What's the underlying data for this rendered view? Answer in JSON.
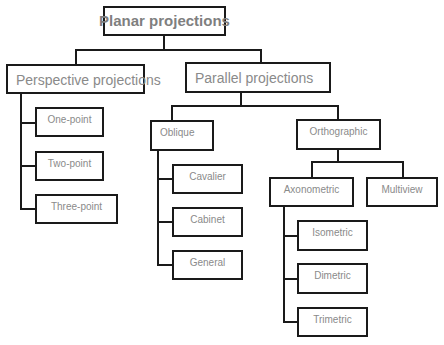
{
  "diagram": {
    "type": "tree",
    "root": {
      "label": "Planar projections",
      "children": [
        {
          "label": "Perspective projections",
          "children": [
            {
              "label": "One-point"
            },
            {
              "label": "Two-point"
            },
            {
              "label": "Three-point"
            }
          ]
        },
        {
          "label": "Parallel projections",
          "children": [
            {
              "label": "Oblique",
              "children": [
                {
                  "label": "Cavalier"
                },
                {
                  "label": "Cabinet"
                },
                {
                  "label": "General"
                }
              ]
            },
            {
              "label": "Orthographic",
              "children": [
                {
                  "label": "Axonometric",
                  "children": [
                    {
                      "label": "Isometric"
                    },
                    {
                      "label": "Dimetric"
                    },
                    {
                      "label": "Trimetric"
                    }
                  ]
                },
                {
                  "label": "Multiview"
                }
              ]
            }
          ]
        }
      ]
    }
  },
  "nodes": {
    "planar": "Planar projections",
    "perspective": "Perspective projections",
    "one_point": "One-point",
    "two_point": "Two-point",
    "three_point": "Three-point",
    "parallel": "Parallel projections",
    "oblique": "Oblique",
    "cavalier": "Cavalier",
    "cabinet": "Cabinet",
    "general": "General",
    "orthographic": "Orthographic",
    "axonometric": "Axonometric",
    "multiview": "Multiview",
    "isometric": "Isometric",
    "dimetric": "Dimetric",
    "trimetric": "Trimetric"
  },
  "colors": {
    "border": "#1a1a1a",
    "text": "#8a8a8a",
    "background": "#ffffff"
  }
}
